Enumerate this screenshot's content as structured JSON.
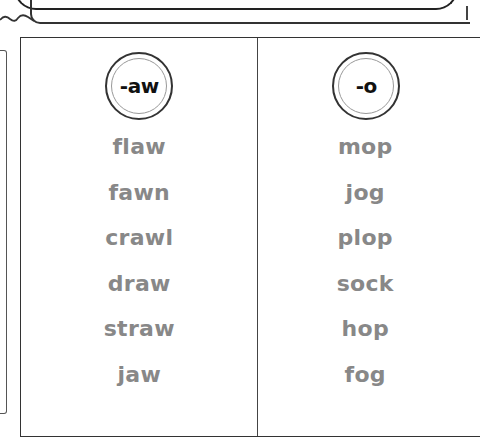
{
  "worksheet": {
    "columns": [
      {
        "header": "-aw",
        "words": [
          "flaw",
          "fawn",
          "crawl",
          "draw",
          "straw",
          "jaw"
        ]
      },
      {
        "header": "-o",
        "words": [
          "mop",
          "jog",
          "plop",
          "sock",
          "hop",
          "fog"
        ]
      }
    ]
  },
  "colors": {
    "word_text": "#888888",
    "header_text": "#111111",
    "border": "#333333"
  }
}
